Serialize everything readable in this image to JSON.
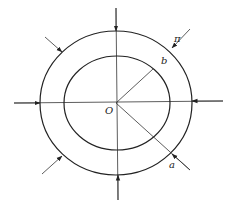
{
  "diagram": {
    "title": "",
    "labels": {
      "origin": "O",
      "inner_radius": "b",
      "outer_radius": "a",
      "pressure": "π"
    },
    "shapes": {
      "center": [
        116,
        103
      ],
      "outer_ellipse": {
        "rx": 76,
        "ry": 72
      },
      "inner_ellipse": {
        "rx": 53,
        "ry": 47
      },
      "radius_b_end": [
        153,
        69
      ],
      "radius_a_end": [
        190,
        170
      ]
    },
    "arrows": [
      {
        "name": "top",
        "from": [
          116,
          8
        ],
        "to": [
          116,
          31
        ]
      },
      {
        "name": "bottom",
        "from": [
          118,
          200
        ],
        "to": [
          118,
          175
        ]
      },
      {
        "name": "left",
        "from": [
          14,
          103
        ],
        "to": [
          40,
          103
        ]
      },
      {
        "name": "right",
        "from": [
          223,
          101
        ],
        "to": [
          192,
          101
        ]
      },
      {
        "name": "top-left",
        "from": [
          45,
          37
        ],
        "to": [
          62,
          52
        ]
      },
      {
        "name": "top-right",
        "from": [
          190,
          29
        ],
        "to": [
          172,
          48
        ]
      },
      {
        "name": "bottom-left",
        "from": [
          42,
          174
        ],
        "to": [
          62,
          156
        ]
      },
      {
        "name": "bottom-right",
        "from": [
          190,
          170
        ],
        "to": [
          172,
          154
        ]
      }
    ],
    "colors": {
      "stroke": "#222222",
      "background": "#ffffff"
    }
  }
}
